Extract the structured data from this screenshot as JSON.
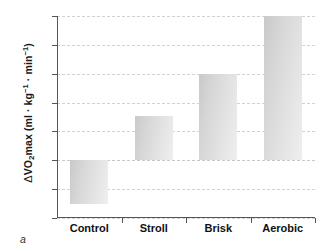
{
  "chart_data": {
    "type": "bar",
    "title": "",
    "subtitle": "",
    "xlabel": "",
    "ylabel": "Δ VO2max (ml · kg⁻¹ · min⁻¹)",
    "categories": [
      "Control",
      "Stroll",
      "Brisk",
      "Aerobic"
    ],
    "values": [
      -1.5,
      1.55,
      3.0,
      5.0
    ],
    "ylim": [
      -2,
      5
    ],
    "yticks": [
      5,
      4,
      3,
      2,
      1,
      0,
      -1,
      -2
    ],
    "ytick_labels": [
      "5",
      "4",
      "3",
      "2",
      "1",
      "0",
      "–1",
      "–2"
    ],
    "grid": true,
    "grid_axis": "y",
    "legend": false,
    "legend_position": "none",
    "bar_color": "#d8d8d8",
    "grid_color": "#d2d2d2",
    "axis_color": "#555555"
  },
  "ylabel_parts": {
    "delta": "Δ",
    "vo": "VO",
    "two": "2",
    "max_units": "max (ml · kg",
    "exp1": "−1",
    "middot": " · min",
    "exp2": "−1",
    "close": ")"
  },
  "caption": {
    "panel_letter": "a"
  }
}
